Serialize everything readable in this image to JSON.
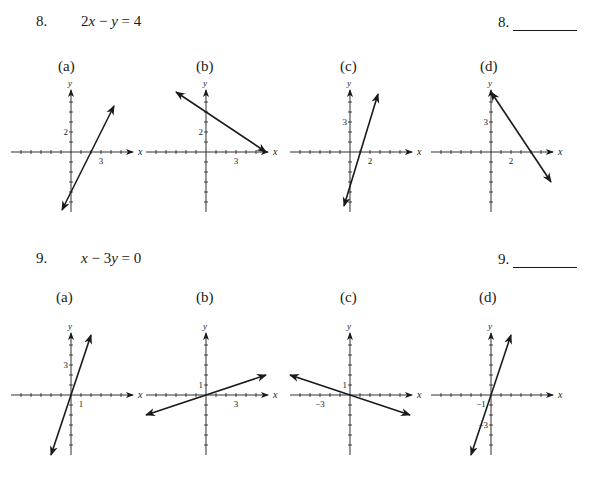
{
  "problems": [
    {
      "number": "8.",
      "equation_parts": [
        "2",
        "x",
        " − ",
        "y",
        " = 4"
      ],
      "equation": "2x − y = 4",
      "answer_label": "8.",
      "options": [
        {
          "label": "(a)",
          "x_tick_label": "3",
          "x_tick_value": 3,
          "y_tick_label": "2",
          "y_tick_value": 2,
          "line": {
            "from": [
              -0.9,
              -5.8
            ],
            "to": [
              4.3,
              4.6
            ]
          }
        },
        {
          "label": "(b)",
          "x_tick_label": "3",
          "x_tick_value": 3,
          "y_tick_label": "2",
          "y_tick_value": 2,
          "line": {
            "from": [
              -3.0,
              6.0
            ],
            "to": [
              6.0,
              0.0
            ]
          }
        },
        {
          "label": "(c)",
          "x_tick_label": "2",
          "x_tick_value": 2,
          "y_tick_label": "3",
          "y_tick_value": 3,
          "line": {
            "from": [
              -0.6,
              -5.4
            ],
            "to": [
              2.8,
              5.8
            ]
          }
        },
        {
          "label": "(d)",
          "x_tick_label": "2",
          "x_tick_value": 2,
          "y_tick_label": "3",
          "y_tick_value": 3,
          "line": {
            "from": [
              0.0,
              6.0
            ],
            "to": [
              6.0,
              -3.0
            ]
          }
        }
      ]
    },
    {
      "number": "9.",
      "equation_parts": [
        "",
        "x",
        " − 3",
        "y",
        " = 0"
      ],
      "equation": "x − 3y = 0",
      "answer_label": "9.",
      "options": [
        {
          "label": "(a)",
          "x_tick_label": "1",
          "x_tick_value": 1,
          "y_tick_label": "3",
          "y_tick_value": 3,
          "line": {
            "from": [
              -2.0,
              -6.0
            ],
            "to": [
              2.0,
              6.0
            ]
          }
        },
        {
          "label": "(b)",
          "x_tick_label": "3",
          "x_tick_value": 3,
          "y_tick_label": "1",
          "y_tick_value": 1,
          "line": {
            "from": [
              -6.0,
              -2.0
            ],
            "to": [
              6.0,
              2.0
            ]
          }
        },
        {
          "label": "(c)",
          "x_tick_label": "−3",
          "x_tick_value": -3,
          "y_tick_label": "1",
          "y_tick_value": 1,
          "line": {
            "from": [
              -6.0,
              2.0
            ],
            "to": [
              6.0,
              -2.0
            ]
          }
        },
        {
          "label": "(d)",
          "x_tick_label": "−1",
          "x_tick_value": -1,
          "y_tick_label": "−3",
          "y_tick_value": -3,
          "line": {
            "from": [
              -2.0,
              -6.0
            ],
            "to": [
              2.0,
              6.0
            ]
          }
        }
      ]
    }
  ],
  "axis": {
    "x_label": "x",
    "y_label": "y",
    "x_range": [
      -6,
      6
    ],
    "y_range": [
      -6,
      6
    ],
    "unit_px": 10
  },
  "colors": {
    "ink": "#1a1a1a",
    "background": "#ffffff"
  }
}
